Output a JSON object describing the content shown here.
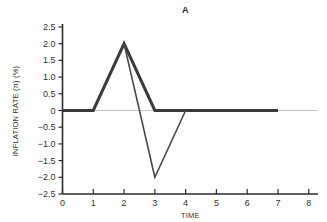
{
  "chart_data": {
    "type": "line",
    "title": "A",
    "xlabel": "TIME",
    "ylabel": "INFLATION RATE (π) (%)",
    "xlim": [
      0,
      8.3
    ],
    "ylim": [
      -2.5,
      2.5
    ],
    "xticks": [
      0,
      1,
      2,
      3,
      4,
      5,
      6,
      7,
      8
    ],
    "xtick_labels": [
      "0",
      "1",
      "2",
      "3",
      "4",
      "5",
      "6",
      "7",
      "8"
    ],
    "yticks": [
      2.5,
      2.0,
      1.5,
      1.0,
      0.5,
      0,
      -0.5,
      -1.0,
      -1.5,
      -2.0,
      -2.5
    ],
    "ytick_labels": [
      "2.5",
      "2.0",
      "1.5",
      "1.0",
      "0.5",
      "0",
      "−0.5",
      "−1.0",
      "−1.5",
      "−2.0",
      "−2.5"
    ],
    "grid": false,
    "legend": null,
    "zero_reference_line": {
      "y": 0,
      "color": "#9a9a9a",
      "width": 0.6,
      "x_from": 0,
      "x_to": 8.3
    },
    "series": [
      {
        "name": "thick-path",
        "color": "#3a3a3a",
        "line_width": 3.0,
        "x": [
          0,
          1,
          2,
          3,
          7
        ],
        "y": [
          0,
          0,
          2.0,
          0,
          0
        ]
      },
      {
        "name": "thin-path",
        "color": "#4a4a4a",
        "line_width": 1.6,
        "x": [
          2,
          3,
          4
        ],
        "y": [
          2.0,
          -2.0,
          0
        ]
      }
    ]
  }
}
